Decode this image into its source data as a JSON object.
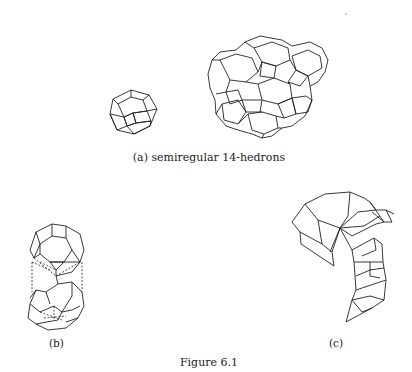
{
  "figure": {
    "title": "Figure 6.1",
    "panels": [
      {
        "id": "a",
        "label": "(a) semiregular 14-hedrons",
        "content": "single truncated octahedron and a cluster of space-filling truncated octahedra"
      },
      {
        "id": "b",
        "label": "(b)",
        "content": "two stacked 14-hedrons with dashed hidden edges"
      },
      {
        "id": "c",
        "label": "(c)",
        "content": "curved chain of polyhedral faces"
      }
    ]
  }
}
